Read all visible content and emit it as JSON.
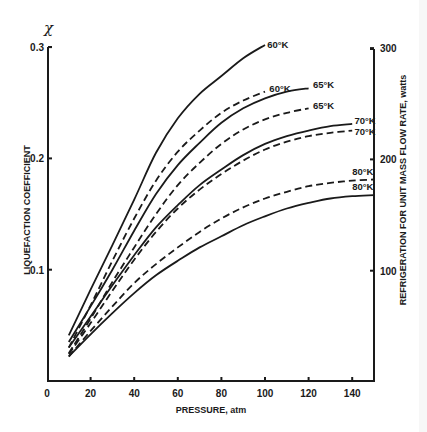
{
  "chart_data": {
    "type": "line",
    "title": "",
    "xlabel": "PRESSURE, atm",
    "ylabel": "LIQUEFACTION COEFFICIENT",
    "ylabel_symbol": "χ",
    "y2label": "REFRIGERATION FOR UNIT MASS FLOW RATE, watts",
    "xlim": [
      0,
      150
    ],
    "ylim": [
      0,
      0.3
    ],
    "y2lim": [
      0,
      300
    ],
    "x_ticks": [
      0,
      20,
      40,
      60,
      80,
      100,
      120,
      140
    ],
    "y_ticks": [
      0.1,
      0.2,
      0.3
    ],
    "y_tick_labels": [
      "0.1",
      "0.2",
      "0.3"
    ],
    "y2_ticks": [
      100,
      200,
      300
    ],
    "grid": false,
    "legend": "inline labels at curve ends",
    "line_style_note": "solid and dashed curves per temperature",
    "series": [
      {
        "name": "60°K",
        "style": "solid",
        "label_pos": [
          101,
          0.302
        ],
        "points": [
          [
            10,
            0.041
          ],
          [
            20,
            0.082
          ],
          [
            30,
            0.122
          ],
          [
            40,
            0.163
          ],
          [
            50,
            0.205
          ],
          [
            60,
            0.236
          ],
          [
            70,
            0.258
          ],
          [
            80,
            0.274
          ],
          [
            90,
            0.29
          ],
          [
            100,
            0.302
          ]
        ]
      },
      {
        "name": "60°K",
        "style": "dashed",
        "label_pos": [
          102,
          0.262
        ],
        "points": [
          [
            10,
            0.03
          ],
          [
            20,
            0.068
          ],
          [
            30,
            0.108
          ],
          [
            40,
            0.146
          ],
          [
            50,
            0.18
          ],
          [
            60,
            0.206
          ],
          [
            70,
            0.225
          ],
          [
            80,
            0.241
          ],
          [
            90,
            0.252
          ],
          [
            100,
            0.26
          ]
        ]
      },
      {
        "name": "65°K",
        "style": "solid",
        "label_pos": [
          122,
          0.266
        ],
        "points": [
          [
            10,
            0.035
          ],
          [
            20,
            0.067
          ],
          [
            30,
            0.1
          ],
          [
            40,
            0.135
          ],
          [
            50,
            0.168
          ],
          [
            60,
            0.194
          ],
          [
            70,
            0.214
          ],
          [
            80,
            0.232
          ],
          [
            90,
            0.245
          ],
          [
            100,
            0.254
          ],
          [
            110,
            0.26
          ],
          [
            120,
            0.263
          ]
        ]
      },
      {
        "name": "65°K",
        "style": "dashed",
        "label_pos": [
          122,
          0.247
        ],
        "points": [
          [
            10,
            0.025
          ],
          [
            20,
            0.056
          ],
          [
            30,
            0.089
          ],
          [
            40,
            0.12
          ],
          [
            50,
            0.15
          ],
          [
            60,
            0.176
          ],
          [
            70,
            0.196
          ],
          [
            80,
            0.213
          ],
          [
            90,
            0.226
          ],
          [
            100,
            0.235
          ],
          [
            110,
            0.241
          ],
          [
            120,
            0.245
          ]
        ]
      },
      {
        "name": "70°K",
        "style": "solid",
        "label_pos": [
          141,
          0.234
        ],
        "points": [
          [
            10,
            0.03
          ],
          [
            20,
            0.058
          ],
          [
            30,
            0.086
          ],
          [
            40,
            0.113
          ],
          [
            50,
            0.138
          ],
          [
            60,
            0.158
          ],
          [
            70,
            0.176
          ],
          [
            80,
            0.19
          ],
          [
            90,
            0.203
          ],
          [
            100,
            0.213
          ],
          [
            110,
            0.22
          ],
          [
            120,
            0.225
          ],
          [
            130,
            0.229
          ],
          [
            140,
            0.231
          ]
        ]
      },
      {
        "name": "70°K",
        "style": "dashed",
        "label_pos": [
          141,
          0.224
        ],
        "points": [
          [
            10,
            0.024
          ],
          [
            20,
            0.052
          ],
          [
            30,
            0.081
          ],
          [
            40,
            0.109
          ],
          [
            50,
            0.134
          ],
          [
            60,
            0.155
          ],
          [
            70,
            0.172
          ],
          [
            80,
            0.186
          ],
          [
            90,
            0.198
          ],
          [
            100,
            0.208
          ],
          [
            110,
            0.215
          ],
          [
            120,
            0.22
          ],
          [
            130,
            0.223
          ],
          [
            140,
            0.225
          ]
        ]
      },
      {
        "name": "80°K",
        "style": "dashed",
        "label_pos": [
          140,
          0.188
        ],
        "points": [
          [
            10,
            0.022
          ],
          [
            20,
            0.045
          ],
          [
            30,
            0.067
          ],
          [
            40,
            0.088
          ],
          [
            50,
            0.105
          ],
          [
            60,
            0.12
          ],
          [
            70,
            0.134
          ],
          [
            80,
            0.146
          ],
          [
            90,
            0.156
          ],
          [
            100,
            0.164
          ],
          [
            110,
            0.17
          ],
          [
            120,
            0.175
          ],
          [
            130,
            0.178
          ],
          [
            140,
            0.18
          ],
          [
            150,
            0.181
          ]
        ]
      },
      {
        "name": "80°K",
        "style": "solid",
        "label_pos": [
          140,
          0.174
        ],
        "points": [
          [
            10,
            0.022
          ],
          [
            20,
            0.042
          ],
          [
            30,
            0.061
          ],
          [
            40,
            0.079
          ],
          [
            50,
            0.095
          ],
          [
            60,
            0.108
          ],
          [
            70,
            0.12
          ],
          [
            80,
            0.13
          ],
          [
            90,
            0.14
          ],
          [
            100,
            0.148
          ],
          [
            110,
            0.155
          ],
          [
            120,
            0.16
          ],
          [
            130,
            0.164
          ],
          [
            140,
            0.166
          ],
          [
            150,
            0.167
          ]
        ]
      }
    ]
  },
  "colors": {
    "ink": "#1a1a1a",
    "background": "#ffffff"
  }
}
